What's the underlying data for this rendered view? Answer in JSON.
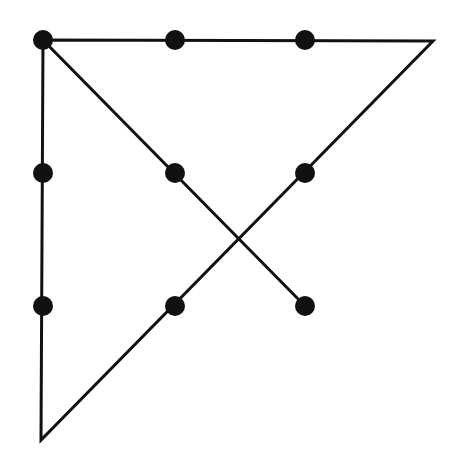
{
  "diagram": {
    "title": "",
    "background": "#ffffff",
    "ink_color": "#111111",
    "dot_radius": 10,
    "stroke_width": 3,
    "dots": [
      {
        "row": 0,
        "col": 0,
        "x": 43,
        "y": 40
      },
      {
        "row": 0,
        "col": 1,
        "x": 175,
        "y": 40
      },
      {
        "row": 0,
        "col": 2,
        "x": 305,
        "y": 40
      },
      {
        "row": 1,
        "col": 0,
        "x": 43,
        "y": 173
      },
      {
        "row": 1,
        "col": 1,
        "x": 175,
        "y": 173
      },
      {
        "row": 1,
        "col": 2,
        "x": 305,
        "y": 173
      },
      {
        "row": 2,
        "col": 0,
        "x": 43,
        "y": 306
      },
      {
        "row": 2,
        "col": 1,
        "x": 175,
        "y": 306
      },
      {
        "row": 2,
        "col": 2,
        "x": 305,
        "y": 306
      }
    ],
    "path_points": [
      {
        "x": 305,
        "y": 306
      },
      {
        "x": 43,
        "y": 40
      },
      {
        "x": 433,
        "y": 41
      },
      {
        "x": 41,
        "y": 440
      },
      {
        "x": 43,
        "y": 40
      }
    ]
  }
}
